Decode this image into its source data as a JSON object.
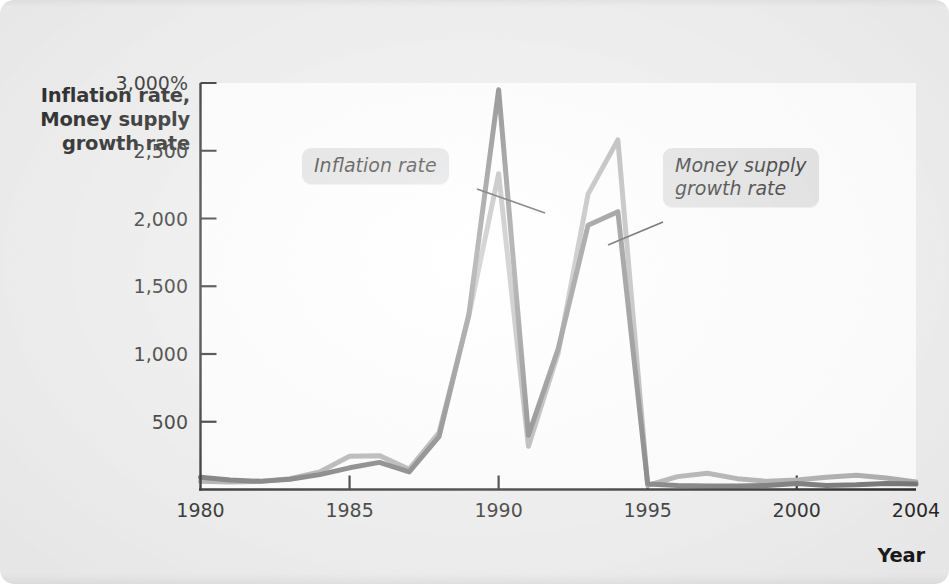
{
  "figure": {
    "y_axis_title": "Inflation rate,\nMoney supply\ngrowth rate",
    "x_axis_title": "Year",
    "callouts": {
      "inflation": "Inflation rate",
      "money_supply": "Money supply\ngrowth rate"
    },
    "colors": {
      "inflation_line": "#6e6e6e",
      "money_supply_line": "#a9a9a9",
      "axis": "#1b1b1b",
      "panel_background": "#ffffff",
      "figure_background": "#eeeeee",
      "callout_background": "#dedede"
    }
  },
  "chart_data": {
    "type": "line",
    "title": "",
    "subtitle": "",
    "xlabel": "Year",
    "ylabel": "Inflation rate, Money supply growth rate",
    "xlim": [
      1980,
      2004
    ],
    "ylim": [
      0,
      3000
    ],
    "grid": false,
    "legend_position": "inline-callouts",
    "y_tick_labels": [
      "3,000%",
      "2,500",
      "2,000",
      "1,500",
      "1,000",
      "500"
    ],
    "y_ticks": [
      3000,
      2500,
      2000,
      1500,
      1000,
      500
    ],
    "x_tick_labels": [
      "1980",
      "1985",
      "1990",
      "1995",
      "2000",
      "2004"
    ],
    "x_ticks": [
      1980,
      1985,
      1990,
      1995,
      2000,
      2004
    ],
    "x": [
      1980,
      1981,
      1982,
      1983,
      1984,
      1985,
      1986,
      1987,
      1988,
      1989,
      1990,
      1991,
      1992,
      1993,
      1994,
      1995,
      1996,
      1997,
      1998,
      1999,
      2000,
      2001,
      2002,
      2003,
      2004
    ],
    "series": [
      {
        "name": "Inflation rate",
        "color": "#6e6e6e",
        "values": [
          90,
          70,
          60,
          75,
          110,
          160,
          200,
          130,
          390,
          1290,
          2950,
          400,
          1040,
          1950,
          2050,
          40,
          30,
          25,
          25,
          30,
          45,
          30,
          35,
          45,
          40
        ]
      },
      {
        "name": "Money supply growth rate",
        "color": "#a9a9a9",
        "values": [
          60,
          55,
          60,
          80,
          130,
          245,
          250,
          150,
          420,
          1280,
          2330,
          320,
          1010,
          2180,
          2580,
          30,
          95,
          120,
          80,
          60,
          70,
          90,
          105,
          85,
          55
        ]
      }
    ],
    "annotations": [
      {
        "text": "Inflation rate",
        "points_to_x": 1990,
        "points_to_y": 2800
      },
      {
        "text": "Money supply growth rate",
        "points_to_x": 1994,
        "points_to_y": 2400
      }
    ]
  }
}
